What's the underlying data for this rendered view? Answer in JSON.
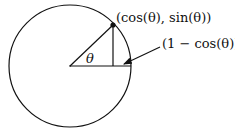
{
  "diagram": {
    "colors": {
      "stroke": "#111111",
      "background": "#ffffff"
    },
    "circle": {
      "cx": 70,
      "cy": 66,
      "r": 61
    },
    "point_label": "(cos(θ), sin(θ))",
    "gap_label": "(1 − cos(θ))",
    "angle_label": "θ"
  }
}
